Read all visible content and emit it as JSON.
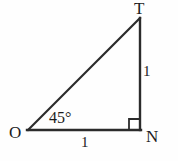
{
  "figure": {
    "kind": "geometry-diagram",
    "background_color": "#fefefe",
    "stroke_color": "#2b2b2b",
    "text_color": "#1c1c1c",
    "vertices": {
      "T": {
        "label": "T",
        "x": 140,
        "y": 18
      },
      "O": {
        "label": "O",
        "x": 28,
        "y": 130
      },
      "N": {
        "label": "N",
        "x": 140,
        "y": 130
      }
    },
    "sides": {
      "right_leg": {
        "label": "1",
        "from": "T",
        "to": "N"
      },
      "bottom_leg": {
        "label": "1",
        "from": "O",
        "to": "N"
      },
      "hypotenuse": {
        "label": "",
        "from": "O",
        "to": "T"
      }
    },
    "angles": {
      "at_O": {
        "label": "45°",
        "value": 45
      },
      "at_N": {
        "label": "",
        "value": 90,
        "marker": "right-angle-square"
      }
    }
  }
}
